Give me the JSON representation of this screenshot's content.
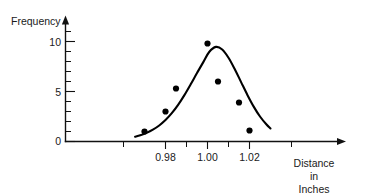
{
  "chart_data": {
    "type": "scatter",
    "title": "",
    "subtitle": "",
    "xlabel": "Distance in Inches",
    "xlabel_lines": [
      "Distance",
      "in",
      "Inches"
    ],
    "ylabel": "Frequency",
    "xlim": [
      0.9645,
      1.0305
    ],
    "ylim": [
      0,
      11.6
    ],
    "grid": false,
    "legend": null,
    "x_ticks": [
      0.98,
      1.0,
      1.02
    ],
    "x_tick_labels": [
      "0.98",
      "1.00",
      "1.02"
    ],
    "x_minor_ticks": [
      0.97,
      0.99,
      1.01,
      1.03
    ],
    "y_ticks": [
      0,
      5,
      10
    ],
    "y_tick_labels": [
      "0",
      "5",
      "10"
    ],
    "y_minor_ticks": [
      1,
      2,
      3,
      4,
      6,
      7,
      8,
      9
    ],
    "x": [
      0.97,
      0.98,
      0.985,
      1.0,
      1.005,
      1.015,
      1.02
    ],
    "values": [
      1.0,
      3.0,
      5.3,
      9.8,
      6.0,
      3.9,
      1.1
    ],
    "points": [
      {
        "x": 0.97,
        "y": 1.0
      },
      {
        "x": 0.98,
        "y": 3.0
      },
      {
        "x": 0.985,
        "y": 5.3
      },
      {
        "x": 1.0,
        "y": 9.8
      },
      {
        "x": 1.005,
        "y": 6.0
      },
      {
        "x": 1.015,
        "y": 3.9
      },
      {
        "x": 1.02,
        "y": 1.1
      }
    ],
    "series": [
      {
        "name": "observed frequency",
        "type": "scatter",
        "x": [
          0.97,
          0.98,
          0.985,
          1.0,
          1.005,
          1.015,
          1.02
        ],
        "values": [
          1.0,
          3.0,
          5.3,
          9.8,
          6.0,
          3.9,
          1.1
        ]
      },
      {
        "name": "fitted normal curve",
        "type": "line",
        "curve_mean": 1.0008,
        "curve_peak": 9.95,
        "curve_sigma": 0.0088,
        "x": [
          0.9655,
          0.968,
          0.971,
          0.974,
          0.977,
          0.98,
          0.983,
          0.986,
          0.989,
          0.992,
          0.995,
          0.998,
          1.0008,
          1.004,
          1.007,
          1.01,
          1.013,
          1.016,
          1.019,
          1.022,
          1.025,
          1.028,
          1.03
        ],
        "values": [
          0.47,
          0.62,
          0.86,
          1.18,
          1.6,
          2.14,
          2.83,
          3.66,
          4.64,
          5.72,
          6.85,
          7.94,
          8.95,
          9.46,
          9.2,
          8.38,
          7.23,
          5.94,
          4.66,
          3.49,
          2.5,
          1.72,
          1.3
        ]
      }
    ],
    "colors": {
      "axis": "#111111",
      "curve": "#000000",
      "points": "#000000",
      "text": "#1a1a1a",
      "background": "#ffffff"
    }
  },
  "axes": {
    "y_axis_label": "Frequency",
    "x_axis_label_line1": "Distance",
    "x_axis_label_line2": "in",
    "x_axis_label_line3": "Inches",
    "y_tick_0": "0",
    "y_tick_5": "5",
    "y_tick_10": "10",
    "x_tick_098": "0.98",
    "x_tick_100": "1.00",
    "x_tick_102": "1.02"
  }
}
